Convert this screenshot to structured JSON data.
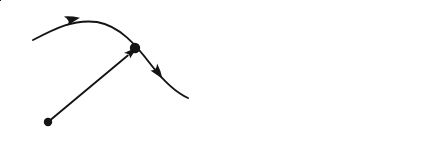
{
  "figure": {
    "background_color": "#ffffff",
    "ink_color": "#141414",
    "width": 448,
    "height": 164,
    "caption_style": "two-panel vector diagram"
  },
  "panels": [
    {
      "id": "panel-a",
      "label": "(a)",
      "label_x": 22,
      "label_y": 156,
      "description": "Position vector to a point on a trajectory curve",
      "origin": {
        "label": "O",
        "label_x": 20,
        "label_y": 130,
        "dot_x": 48,
        "dot_y": 122,
        "dot_r": 4.2
      },
      "vector": {
        "label_bold": "x",
        "label_open_paren": "(",
        "label_var": "t",
        "label_close_paren": ")",
        "label_full": "x(t)",
        "label_x": 89,
        "label_y": 95,
        "label_size": 20,
        "from_x": 48,
        "from_y": 122,
        "to_x": 132,
        "to_y": 52,
        "arrow_size": 11
      },
      "trajectory": {
        "path": "M 33 40 C 56 28 74 19 97 22 C 120 26 136 45 152 66 C 166 84 177 93 188 98",
        "stroke_width": 1.9,
        "marker_dot": {
          "x": 135,
          "y": 48,
          "r": 5.2
        },
        "arrows": [
          {
            "x": 73,
            "y": 19.5,
            "angle": -14,
            "size": 13
          },
          {
            "x": 158,
            "y": 73,
            "angle": 52,
            "size": 13
          }
        ]
      }
    },
    {
      "id": "panel-b",
      "label": "(b)",
      "label_x": 228,
      "label_y": 156,
      "description": "Same trajectory shown relative to x, y, z coordinate axes",
      "origin": {
        "dot_x": 245,
        "dot_y": 124,
        "dot_r": 5.0
      },
      "axes": [
        {
          "name": "z-axis",
          "label": "z",
          "label_x": 228,
          "label_y": 26,
          "from_x": 245,
          "from_y": 124,
          "to_x": 245,
          "to_y": 16,
          "arrow_angle": -90,
          "arrow_size": 12
        },
        {
          "name": "y-axis",
          "label": "y",
          "label_x": 292,
          "label_y": 93,
          "from_x": 245,
          "from_y": 124,
          "to_x": 288,
          "to_y": 74,
          "arrow_angle": -49,
          "arrow_size": 12
        },
        {
          "name": "x-axis",
          "label": "x",
          "label_x": 404,
          "label_y": 150,
          "from_x": 245,
          "from_y": 124,
          "to_x": 408,
          "to_y": 124,
          "arrow_angle": 0,
          "arrow_size": 12
        }
      ],
      "trajectory": {
        "path": "M 262 40 C 282 28 298 20 318 24 C 338 29 350 48 363 67 C 372 80 383 84 393 81",
        "stroke_width": 1.9,
        "marker_dot": {
          "x": 340,
          "y": 47,
          "r": 4.6
        },
        "arrows": [
          {
            "x": 294,
            "y": 21,
            "angle": -12,
            "size": 12.5
          },
          {
            "x": 370,
            "y": 73,
            "angle": 53,
            "size": 12.5
          }
        ]
      }
    }
  ]
}
